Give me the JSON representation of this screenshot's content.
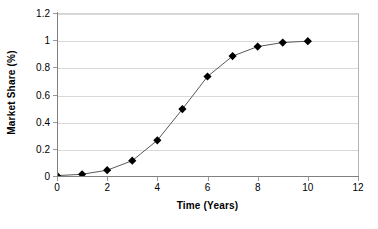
{
  "chart_data": {
    "type": "line",
    "title": "",
    "subtitle": "",
    "xlabel": "Time (Years)",
    "ylabel": "Market Share (%)",
    "xlim": [
      0,
      12
    ],
    "ylim": [
      0,
      1.2
    ],
    "x_ticks": [
      0,
      2,
      4,
      6,
      8,
      10,
      12
    ],
    "x_tick_labels": [
      "0",
      "2",
      "4",
      "6",
      "8",
      "10",
      "12"
    ],
    "y_ticks": [
      0,
      0.2,
      0.4,
      0.6,
      0.8,
      1,
      1.2
    ],
    "y_tick_labels": [
      "0",
      "0.2",
      "0.4",
      "0.6",
      "0.8",
      "1",
      "1.2"
    ],
    "grid": {
      "horizontal": true,
      "vertical": false,
      "color": "#d9d9d9"
    },
    "legend": {
      "visible": false,
      "position": "none",
      "entries": []
    },
    "marker": {
      "shape": "diamond",
      "color": "#000000",
      "size": 5
    },
    "line": {
      "color": "#595959",
      "width": 1
    },
    "annotations": [],
    "x": [
      0,
      1,
      2,
      3,
      4,
      5,
      6,
      7,
      8,
      9,
      10
    ],
    "series": [
      {
        "name": "Market Share",
        "values": [
          0.01,
          0.02,
          0.05,
          0.12,
          0.27,
          0.5,
          0.74,
          0.89,
          0.96,
          0.99,
          1.0
        ]
      }
    ]
  }
}
